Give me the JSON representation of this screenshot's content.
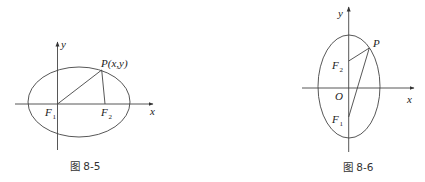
{
  "figures": [
    {
      "caption": "图 8-5",
      "axis_labels": {
        "x": "x",
        "y": "y"
      },
      "point_label": "P(x,y)",
      "foci": [
        {
          "name": "F",
          "sub": "1"
        },
        {
          "name": "F",
          "sub": "2"
        }
      ],
      "description": "Horizontal ellipse with focus F1 at origin and F2 on positive x-axis; point P(x,y) joined to both foci",
      "stroke_color": "#444444"
    },
    {
      "caption": "图 8-6",
      "axis_labels": {
        "x": "x",
        "y": "y"
      },
      "origin_label": "O",
      "point_label": "P",
      "foci": [
        {
          "name": "F",
          "sub": "1"
        },
        {
          "name": "F",
          "sub": "2"
        }
      ],
      "description": "Vertical ellipse centered at O with foci F2 above and F1 below on the y-axis; point P joined to both foci",
      "stroke_color": "#444444"
    }
  ]
}
